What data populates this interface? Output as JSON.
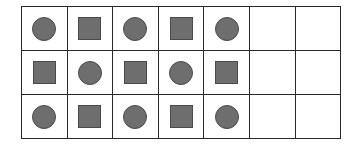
{
  "grid": {
    "columns": 7,
    "rows": 3,
    "shape_color": "#6e6e6e",
    "line_color": "#2a2a2a",
    "cells": [
      [
        "circle",
        "square",
        "circle",
        "square",
        "circle",
        "empty",
        "empty"
      ],
      [
        "square",
        "circle",
        "square",
        "circle",
        "square",
        "empty",
        "empty"
      ],
      [
        "circle",
        "square",
        "circle",
        "square",
        "circle",
        "empty",
        "empty"
      ]
    ]
  }
}
